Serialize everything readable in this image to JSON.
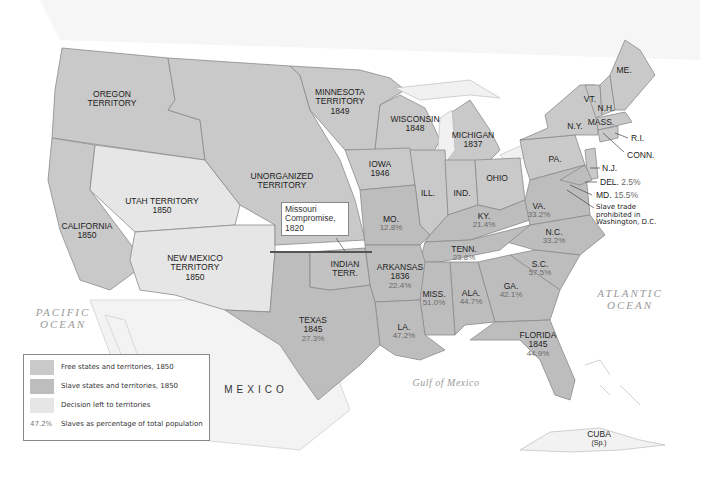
{
  "map": {
    "title": "Slavery and the Compromise of 1850",
    "colors": {
      "free": "#c9c9c9",
      "slave": "#bdbdbd",
      "decision_left": "#e6e6e6",
      "water": "#f4f4f4",
      "border": "#8a8a8a",
      "compromise_line": "#555555"
    },
    "regions": {
      "oregon": {
        "name": "OREGON\nTERRITORY"
      },
      "minnesota": {
        "name": "MINNESOTA\nTERRITORY",
        "year": "1849"
      },
      "wisconsin": {
        "name": "WISCONSIN",
        "year": "1848"
      },
      "michigan": {
        "name": "MICHIGAN",
        "year": "1837"
      },
      "iowa": {
        "name": "IOWA",
        "year": "1946"
      },
      "unorganized": {
        "name": "UNORGANIZED\nTERRITORY"
      },
      "utah": {
        "name": "UTAH TERRITORY",
        "year": "1850"
      },
      "california": {
        "name": "CALIFORNIA",
        "year": "1850"
      },
      "new_mexico": {
        "name": "NEW MEXICO\nTERRITORY",
        "year": "1850"
      },
      "indian": {
        "name": "INDIAN\nTERR."
      },
      "texas": {
        "name": "TEXAS",
        "year": "1845",
        "pct": "27.3%"
      },
      "missouri": {
        "name": "MO.",
        "pct": "12.8%"
      },
      "arkansas": {
        "name": "ARKANSAS",
        "year": "1836",
        "pct": "22.4%"
      },
      "louisiana": {
        "name": "LA.",
        "pct": "47.2%"
      },
      "illinois": {
        "name": "ILL."
      },
      "indiana": {
        "name": "IND."
      },
      "ohio": {
        "name": "OHIO"
      },
      "kentucky": {
        "name": "KY.",
        "pct": "21.4%"
      },
      "tennessee": {
        "name": "TENN.",
        "pct": "23.8%"
      },
      "mississippi": {
        "name": "MISS.",
        "pct": "51.0%"
      },
      "alabama": {
        "name": "ALA.",
        "pct": "44.7%"
      },
      "georgia": {
        "name": "GA.",
        "pct": "42.1%"
      },
      "south_carolina": {
        "name": "S.C.",
        "pct": "57.5%"
      },
      "north_carolina": {
        "name": "N.C.",
        "pct": "33.2%"
      },
      "virginia": {
        "name": "VA.",
        "pct": "33.2%"
      },
      "florida": {
        "name": "FLORIDA",
        "year": "1845",
        "pct": "44.9%"
      },
      "pennsylvania": {
        "name": "PA."
      },
      "new_york": {
        "name": "N.Y."
      },
      "vermont": {
        "name": "VT."
      },
      "new_hampshire": {
        "name": "N.H."
      },
      "maine": {
        "name": "ME."
      },
      "massachusetts": {
        "name": "MASS."
      },
      "rhode_island": {
        "name": "R.I."
      },
      "connecticut": {
        "name": "CONN."
      },
      "new_jersey": {
        "name": "N.J."
      },
      "delaware": {
        "name": "DEL.",
        "pct": "2.5%"
      },
      "maryland": {
        "name": "MD.",
        "pct": "15.5%"
      },
      "cuba": {
        "name": "CUBA",
        "note": "(Sp.)"
      }
    },
    "annotations": {
      "missouri_compromise": "Missouri Compromise, 1820",
      "dc_note": "Slave trade\nprohibited in\nWashington, D.C."
    },
    "water_labels": {
      "pacific": "PACIFIC\nOCEAN",
      "atlantic": "ATLANTIC\nOCEAN",
      "gulf": "Gulf of Mexico"
    },
    "countries": {
      "mexico": "MEXICO"
    }
  },
  "legend": {
    "items": [
      {
        "label": "Free states and territories, 1850",
        "swatch": "#c9c9c9"
      },
      {
        "label": "Slave states and territories, 1850",
        "swatch": "#bdbdbd"
      },
      {
        "label": "Decision left to territories",
        "swatch": "#e6e6e6"
      }
    ],
    "pct_sample": "47.2%",
    "pct_label": "Slaves as percentage of total population"
  }
}
